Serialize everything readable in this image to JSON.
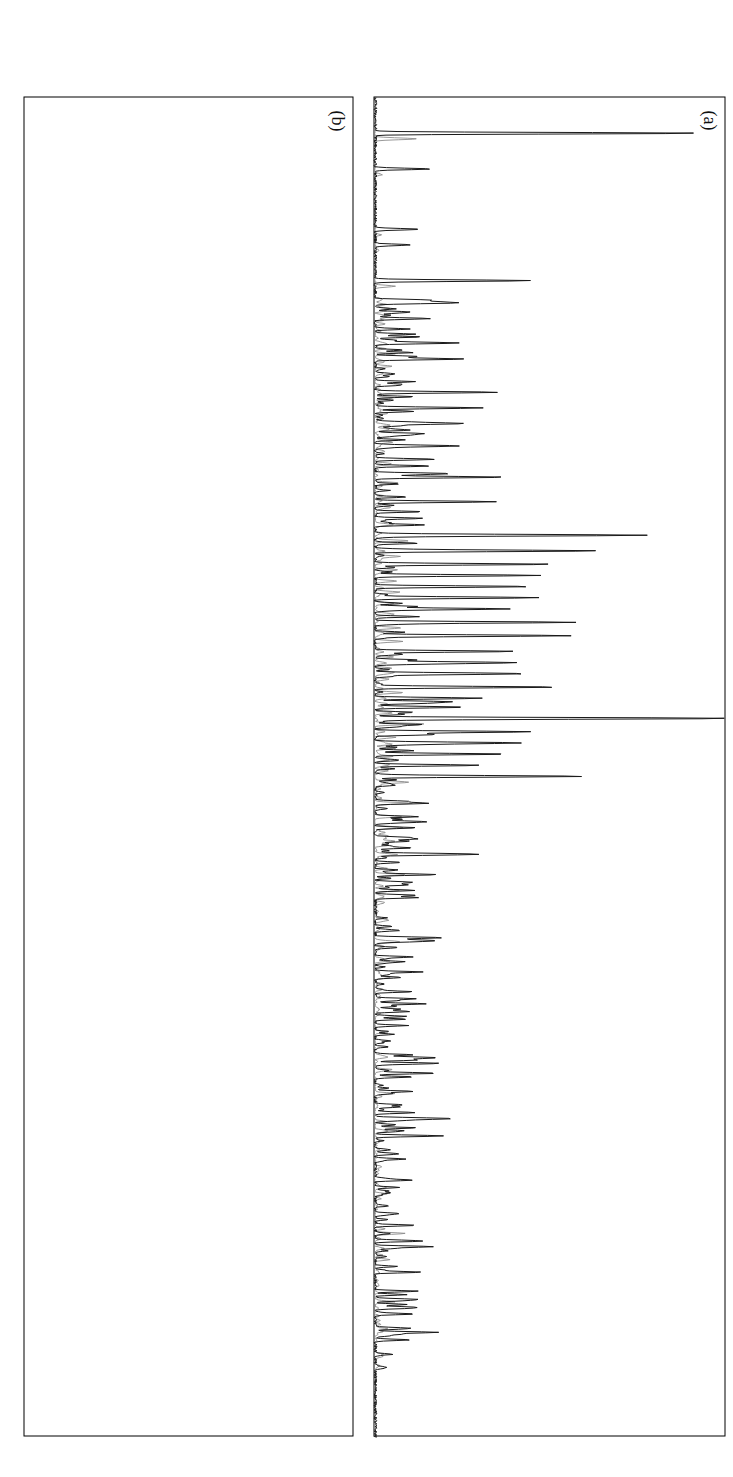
{
  "figure": {
    "orientation_note": "rotated",
    "panel_a_label": "(a)",
    "panel_b_label": "(b)"
  },
  "panel_a": {
    "caption_direct": "direct GC",
    "caption_direct_ref": "cf. Path 2a, Figure 4.10",
    "caption_silylated": "silylated",
    "caption_silylated_ref": "cf. Path 2b, Figure 4.10",
    "y_axis_title": "counts",
    "y_axis_multiplier": "x 100000",
    "x_axis_title": "retention time, min",
    "y_ticks_left": [
      "0.0",
      "0.2",
      "0.4",
      "0.6",
      "0.8",
      "1.0",
      "1.2",
      "1.4"
    ],
    "y_ticks_right": [
      "0",
      "1",
      "2",
      "3",
      "4",
      "5",
      "6"
    ],
    "x_ticks": [
      "10",
      "20",
      "30",
      "40",
      "50",
      "60",
      "70"
    ],
    "peak_labels": [
      "325",
      "342",
      "289",
      "175",
      "277",
      "142",
      "222",
      "174",
      "327",
      "210",
      "210",
      "260",
      "323",
      "296",
      "188",
      "20",
      "30",
      "18631",
      "229",
      "184",
      "40",
      "181",
      "234",
      "199",
      "33",
      "32",
      "185",
      "41",
      "39",
      "44",
      "37",
      "17",
      "259",
      "204",
      "45",
      "36",
      "10",
      "52",
      "9",
      "11",
      "228",
      "261",
      "50",
      "56",
      "210",
      "256",
      "201",
      "208"
    ]
  },
  "panel_b": {
    "y_axis_title": "temperature, °C",
    "x_axis_title": "retention time, min",
    "y_ticks": [
      "500",
      "550",
      "600",
      "650",
      "700",
      "750"
    ],
    "x_ticks": [
      "0",
      "10",
      "20",
      "30",
      "40",
      "50",
      "60",
      "70"
    ],
    "scale_title": "scale",
    "scale_unit_line1": "yield, wt.-%",
    "scale_unit_line2": "(by area)",
    "scale_values": [
      "0.05",
      "0.20",
      "0.50",
      "0.95"
    ],
    "legend": [
      {
        "label": "catechols",
        "color": "#ededed"
      },
      {
        "label": "phenols",
        "color": "#c9c9c9"
      },
      {
        "label": "guaiacols",
        "color": "#8f8f8f"
      },
      {
        "label": "benzenes",
        "color": "#d8d8d8"
      },
      {
        "label": "other aromates",
        "color": "#0d0d0d"
      }
    ],
    "bubble_labels": [
      "252",
      "251",
      "175",
      "222",
      "260",
      "223",
      "188",
      "191",
      "181",
      "20",
      "30",
      "31",
      "40",
      "33",
      "32",
      "38",
      "37",
      "47",
      "52",
      "50",
      "66",
      "8",
      "67",
      "10",
      "9",
      "4",
      "203"
    ]
  },
  "chart_data": [
    {
      "type": "line",
      "title": "(a) GC-MS chromatograms",
      "xlabel": "retention time, min",
      "ylabel": "counts",
      "ylabel_multiplier": "x 100000",
      "xlim": [
        10,
        70
      ],
      "ylim_direct": [
        0.0,
        1.4
      ],
      "ylim_silylated": [
        0,
        6
      ],
      "grid": false,
      "series": [
        {
          "name": "direct GC",
          "color": "#1a1a1a",
          "axis": "left",
          "peaks": [
            {
              "x": 11.6,
              "y": 1.3,
              "label": "325"
            },
            {
              "x": 13.2,
              "y": 0.22,
              "label": "342"
            },
            {
              "x": 15.9,
              "y": 0.18,
              "label": "289"
            },
            {
              "x": 16.6,
              "y": 0.14,
              "label": "175"
            },
            {
              "x": 18.2,
              "y": 0.62,
              "label": "277"
            },
            {
              "x": 19.2,
              "y": 0.3,
              "label": "142"
            },
            {
              "x": 19.9,
              "y": 0.22,
              "label": "222"
            },
            {
              "x": 21.0,
              "y": 0.25,
              "label": "174"
            },
            {
              "x": 21.6,
              "y": 0.17,
              "label": "327"
            },
            {
              "x": 23.2,
              "y": 0.46,
              "label": "260"
            },
            {
              "x": 23.9,
              "y": 0.4,
              "label": "323"
            },
            {
              "x": 24.6,
              "y": 0.33,
              "label": "296"
            },
            {
              "x": 25.6,
              "y": 0.28,
              "label": "188"
            },
            {
              "x": 26.2,
              "y": 0.24,
              "label": "20"
            },
            {
              "x": 27.0,
              "y": 0.52,
              "label": "210"
            },
            {
              "x": 28.1,
              "y": 0.48,
              "label": "210"
            },
            {
              "x": 29.6,
              "y": 1.05,
              "label": "30"
            },
            {
              "x": 30.3,
              "y": 0.78,
              "label": "18631"
            },
            {
              "x": 30.9,
              "y": 0.7,
              "label": "229"
            },
            {
              "x": 31.4,
              "y": 0.66,
              "label": "184"
            },
            {
              "x": 31.9,
              "y": 0.62,
              "label": "40"
            },
            {
              "x": 32.4,
              "y": 0.58,
              "label": "181"
            },
            {
              "x": 32.9,
              "y": 0.54,
              "label": "234"
            },
            {
              "x": 33.5,
              "y": 0.8,
              "label": "199"
            },
            {
              "x": 34.1,
              "y": 0.74,
              "label": "33"
            },
            {
              "x": 34.8,
              "y": 0.56,
              "label": "32"
            },
            {
              "x": 35.3,
              "y": 0.5,
              "label": "185"
            },
            {
              "x": 35.8,
              "y": 0.44,
              "label": "41"
            },
            {
              "x": 36.4,
              "y": 0.7,
              "label": "39"
            },
            {
              "x": 36.9,
              "y": 0.4,
              "label": "44"
            },
            {
              "x": 37.3,
              "y": 0.36,
              "label": "37"
            },
            {
              "x": 37.8,
              "y": 1.38,
              "label": "17"
            },
            {
              "x": 38.4,
              "y": 0.62,
              "label": "259"
            },
            {
              "x": 38.9,
              "y": 0.56,
              "label": "204"
            },
            {
              "x": 39.4,
              "y": 0.48,
              "label": "45"
            },
            {
              "x": 39.9,
              "y": 0.42,
              "label": "36"
            },
            {
              "x": 40.4,
              "y": 0.72,
              "label": "10"
            }
          ]
        },
        {
          "name": "silylated",
          "color": "#8c8c8c",
          "axis": "right",
          "peaks": [
            {
              "x": 41.6,
              "y": 0.6,
              "label": "52"
            },
            {
              "x": 42.2,
              "y": 0.48,
              "label": "9"
            },
            {
              "x": 42.7,
              "y": 0.46,
              "label": "11"
            },
            {
              "x": 43.3,
              "y": 0.38,
              "label": "228"
            },
            {
              "x": 43.9,
              "y": 0.32,
              "label": "261"
            },
            {
              "x": 44.8,
              "y": 0.58,
              "label": "50"
            },
            {
              "x": 45.5,
              "y": 0.44,
              "label": "56"
            },
            {
              "x": 47.8,
              "y": 0.34,
              "label": "210"
            },
            {
              "x": 49.4,
              "y": 0.3,
              "label": "256"
            },
            {
              "x": 54.6,
              "y": 0.2,
              "label": "201"
            },
            {
              "x": 56.3,
              "y": 0.18,
              "label": "208"
            }
          ]
        }
      ]
    },
    {
      "type": "scatter",
      "title": "(b) Product map — bubble area = yield, wt.-%",
      "xlabel": "retention time, min",
      "ylabel": "temperature, °C",
      "xlim": [
        0,
        70
      ],
      "ylim": [
        500,
        750
      ],
      "grid": false,
      "size_legend": {
        "unit": "yield, wt.-%",
        "note": "(by area)",
        "values": [
          0.05,
          0.2,
          0.5,
          0.95
        ]
      },
      "groups": [
        {
          "name": "catechols",
          "color": "#ededed",
          "temperature": 700,
          "points": [
            {
              "x": 16.0,
              "r": 4,
              "label": "252"
            },
            {
              "x": 17.0,
              "r": 5,
              "label": "251"
            },
            {
              "x": 20.2,
              "r": 6,
              "label": "222"
            },
            {
              "x": 21.5,
              "r": 4,
              "label": "260"
            },
            {
              "x": 24.3,
              "r": 8,
              "label": "188"
            },
            {
              "x": 29.2,
              "r": 5,
              "label": "191"
            },
            {
              "x": 30.4,
              "r": 16,
              "label": "181"
            },
            {
              "x": 32.0,
              "r": 12
            },
            {
              "x": 33.4,
              "r": 10
            },
            {
              "x": 36.3,
              "r": 18
            },
            {
              "x": 37.4,
              "r": 9
            },
            {
              "x": 38.9,
              "r": 15,
              "label": "203"
            },
            {
              "x": 40.3,
              "r": 12
            },
            {
              "x": 44.0,
              "r": 6
            }
          ]
        },
        {
          "name": "phenols",
          "color": "#c9c9c9",
          "temperature": 650,
          "points": [
            {
              "x": 16.5,
              "r": 3
            },
            {
              "x": 18.3,
              "r": 4
            },
            {
              "x": 19.6,
              "r": 5
            },
            {
              "x": 20.6,
              "r": 5
            },
            {
              "x": 22.0,
              "r": 4
            },
            {
              "x": 23.6,
              "r": 7
            },
            {
              "x": 26.2,
              "r": 8
            },
            {
              "x": 28.5,
              "r": 12
            },
            {
              "x": 30.1,
              "r": 10
            },
            {
              "x": 31.8,
              "r": 9
            },
            {
              "x": 33.2,
              "r": 11
            },
            {
              "x": 35.0,
              "r": 14
            },
            {
              "x": 36.5,
              "r": 10
            },
            {
              "x": 37.8,
              "r": 9
            },
            {
              "x": 39.3,
              "r": 11
            },
            {
              "x": 41.0,
              "r": 8
            },
            {
              "x": 43.5,
              "r": 6
            },
            {
              "x": 45.2,
              "r": 4
            }
          ]
        },
        {
          "name": "guaiacols",
          "color": "#8f8f8f",
          "temperature": 600,
          "points": [
            {
              "x": 17.0,
              "r": 3
            },
            {
              "x": 19.5,
              "r": 3
            },
            {
              "x": 21.0,
              "r": 4
            },
            {
              "x": 23.0,
              "r": 4
            },
            {
              "x": 25.0,
              "r": 4
            },
            {
              "x": 27.0,
              "r": 5
            },
            {
              "x": 29.0,
              "r": 18,
              "label": "30"
            },
            {
              "x": 30.7,
              "r": 6,
              "label": "31"
            },
            {
              "x": 32.1,
              "r": 12,
              "label": "40"
            },
            {
              "x": 33.0,
              "r": 7,
              "label": "33"
            },
            {
              "x": 34.2,
              "r": 13,
              "label": "32"
            },
            {
              "x": 36.4,
              "r": 17,
              "label": "38"
            },
            {
              "x": 37.2,
              "r": 10,
              "label": "37"
            },
            {
              "x": 38.3,
              "r": 11,
              "label": "47"
            },
            {
              "x": 39.6,
              "r": 13,
              "label": "52"
            },
            {
              "x": 43.1,
              "r": 7,
              "label": "50"
            }
          ]
        },
        {
          "name": "benzenes",
          "color": "#d8d8d8",
          "temperature": 550,
          "points": [
            {
              "x": 25.0,
              "r": 3
            },
            {
              "x": 27.0,
              "r": 4
            },
            {
              "x": 29.7,
              "r": 13,
              "label": "66"
            },
            {
              "x": 33.5,
              "r": 6
            },
            {
              "x": 35.5,
              "r": 9,
              "label": "8"
            },
            {
              "x": 37.0,
              "r": 12,
              "label": "67"
            },
            {
              "x": 38.6,
              "r": 8,
              "label": "10"
            },
            {
              "x": 39.8,
              "r": 7,
              "label": "9"
            },
            {
              "x": 42.8,
              "r": 6,
              "label": "4"
            }
          ]
        },
        {
          "name": "other aromates",
          "color": "#0d0d0d",
          "temperature": 650,
          "points": [
            {
              "x": 27.8,
              "r": 4,
              "label": "20"
            }
          ]
        }
      ]
    }
  ]
}
